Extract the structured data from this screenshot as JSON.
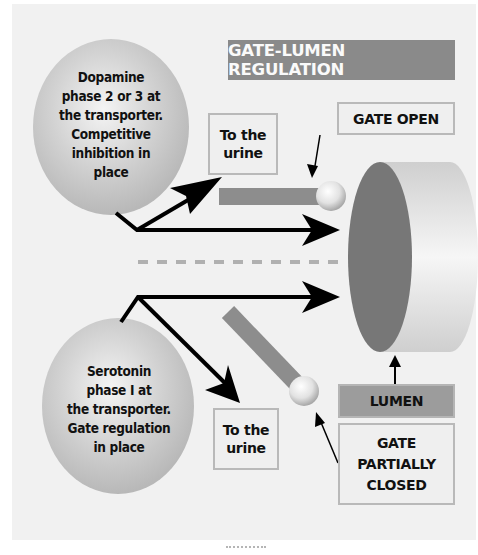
{
  "title": "GATE-LUMEN REGULATION",
  "top_bubble": {
    "lines": [
      "Dopamine",
      "phase 2 or 3 at",
      "the transporter.",
      "Competitive",
      "inhibition in",
      "place"
    ]
  },
  "bottom_bubble": {
    "lines": [
      "Serotonin",
      "phase I at",
      "the transporter.",
      "Gate regulation",
      "in place"
    ]
  },
  "urine_top": {
    "lines": [
      "To the",
      "urine"
    ]
  },
  "urine_bottom": {
    "lines": [
      "To the",
      "urine"
    ]
  },
  "gate_open": {
    "label": "GATE OPEN"
  },
  "lumen": {
    "label": "LUMEN"
  },
  "gate_partially_closed": {
    "lines": [
      "GATE",
      "PARTIALLY",
      "CLOSED"
    ]
  },
  "colors": {
    "background": "#f1f1f1",
    "title_bg": "#8a8a8a",
    "title_text": "#fafafa",
    "bubble": "#c6c6c6",
    "disc_face": "#777777",
    "disc_side": "#dcdcdc",
    "gate_bar": "#8d8d8d",
    "box_border": "#b9b9b9",
    "lumen_bg": "#9c9c9c",
    "arrow": "#000000"
  }
}
